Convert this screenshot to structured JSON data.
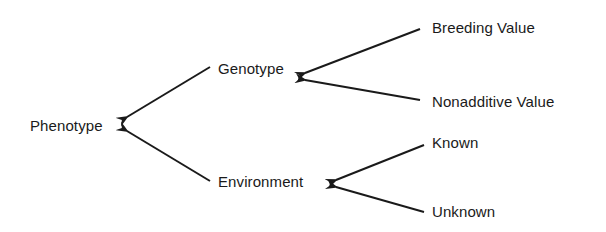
{
  "nodes": {
    "phenotype": "Phenotype",
    "genotype": "Genotype",
    "environment": "Environment",
    "breeding_value": "Breeding Value",
    "nonadditive_value": "Nonadditive Value",
    "known": "Known",
    "unknown": "Unknown"
  },
  "edges": [
    {
      "from": "Genotype",
      "to": "Phenotype"
    },
    {
      "from": "Environment",
      "to": "Phenotype"
    },
    {
      "from": "Breeding Value",
      "to": "Genotype"
    },
    {
      "from": "Nonadditive Value",
      "to": "Genotype"
    },
    {
      "from": "Known",
      "to": "Environment"
    },
    {
      "from": "Unknown",
      "to": "Environment"
    }
  ],
  "colors": {
    "ink": "#1a1a1a",
    "background": "#ffffff"
  }
}
